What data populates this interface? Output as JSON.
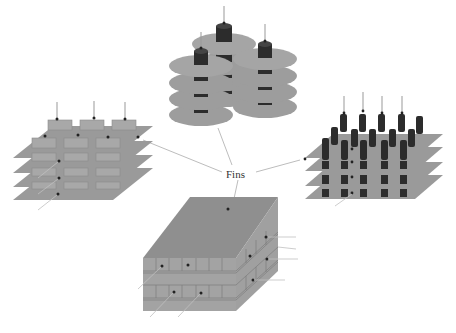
{
  "center_label": "Fins",
  "colors": {
    "fin_gray": "#9a9a9a",
    "fin_edge": "#7d7d7d",
    "pin_dark": "#2c2c2c",
    "leader_line": "#b5b5b5",
    "block_top": "#8f8f8f",
    "block_side": "#a3a3a3"
  },
  "panels": [
    {
      "id": "stacked-disc-fins",
      "position": "top-center",
      "description": "Two stacks of circular disc fins threaded on dark cylindrical cores",
      "stacks": 3,
      "discs_per_stack": 4
    },
    {
      "id": "plate-fins-rect-cells",
      "position": "left",
      "description": "Four parallel square plates with rectangular cell arrays between layers",
      "plates": 4
    },
    {
      "id": "pin-fins-array",
      "position": "right",
      "description": "Four parallel square plates with array of dark cylindrical pins",
      "plates": 4
    },
    {
      "id": "block-channel-fins",
      "position": "bottom-center",
      "description": "Solid rectangular block with layered channel grid on front and side faces"
    }
  ]
}
